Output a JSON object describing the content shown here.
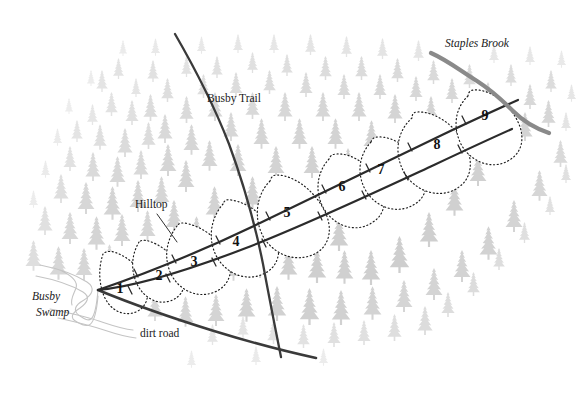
{
  "map": {
    "title_alt": "Forest stand map with numbered transect segments",
    "width": 582,
    "height": 399,
    "background_color": "#ffffff",
    "colors": {
      "tree": "#d2d2d2",
      "tree_light": "#e2e2e2",
      "road_solid": "#3a3a3a",
      "trail": "#3a3a3a",
      "brook": "#8a8a8a",
      "swamp": "#c6c6c6",
      "dotted_boundary": "#1a1a1a",
      "label_text": "#1a1a1a",
      "cell_fill": "#ffffff"
    },
    "labels": [
      {
        "id": "busby-trail",
        "text": "Busby Trail",
        "style": "upright",
        "x": 207,
        "y": 99,
        "font_size": 11.5
      },
      {
        "id": "staples-brook",
        "text": "Staples Brook",
        "style": "italic",
        "x": 445,
        "y": 44,
        "font_size": 11.5
      },
      {
        "id": "hilltop",
        "text": "Hilltop",
        "style": "upright",
        "x": 135,
        "y": 205,
        "font_size": 11.5
      },
      {
        "id": "dirt-road",
        "text": "dirt road",
        "style": "upright",
        "x": 140,
        "y": 334,
        "font_size": 11.5
      },
      {
        "id": "busby-swamp-line1",
        "text": "Busby",
        "style": "italic",
        "x": 32,
        "y": 297,
        "font_size": 11.5
      },
      {
        "id": "busby-swamp-line2",
        "text": "Swamp",
        "style": "italic",
        "x": 36,
        "y": 313,
        "font_size": 11.5
      }
    ],
    "segment_numbers": [
      {
        "label": "1",
        "x": 120,
        "y": 289
      },
      {
        "label": "2",
        "x": 159,
        "y": 276
      },
      {
        "label": "3",
        "x": 194,
        "y": 262
      },
      {
        "label": "4",
        "x": 236,
        "y": 242
      },
      {
        "label": "5",
        "x": 287,
        "y": 213
      },
      {
        "label": "6",
        "x": 342,
        "y": 187
      },
      {
        "label": "7",
        "x": 381,
        "y": 170
      },
      {
        "label": "8",
        "x": 437,
        "y": 145
      },
      {
        "label": "9",
        "x": 485,
        "y": 116
      }
    ],
    "features": {
      "corridor_description": "Two solid parallel curving lines forming a transect band running from lower-left to upper-right, divided into nine numbered cells by dotted cross boundaries.",
      "corridor_upper_path": "M 98 290 C 150 272, 210 246, 262 221 C 320 193, 390 159, 444 133 C 478 117, 500 108, 518 101",
      "corridor_lower_path": "M 98 290 C 142 284, 196 266, 248 246 C 310 222, 380 189, 436 163 C 470 147, 494 136, 512 128",
      "cross_boundaries": [
        "M 104 253 C 101 268, 100 282, 106 297 C 112 311, 124 317, 137 312 C 147 307, 149 296, 146 285 C 142 272, 134 262, 123 256 C 116 252, 109 251, 104 253 Z",
        "M 138 243 C 132 254, 131 268, 137 283 C 143 297, 156 305, 170 302 C 182 298, 187 288, 184 276 C 180 262, 170 251, 158 245 C 150 241, 143 240, 138 243 Z",
        "M 176 227 C 166 240, 164 258, 172 274 C 181 291, 199 298, 215 292 C 229 286, 234 272, 228 258 C 221 241, 206 229, 190 225 C 183 223, 179 224, 176 227 Z",
        "M 222 205 C 210 219, 208 240, 218 257 C 229 275, 250 281, 266 273 C 280 265, 283 249, 275 234 C 266 216, 248 203, 231 201 C 226 200, 224 202, 222 205 Z",
        "M 272 182 C 258 195, 254 218, 264 237 C 276 257, 300 263, 317 253 C 331 244, 333 226, 324 209 C 313 189, 293 176, 278 176 C 274 176, 273 179, 272 182 Z",
        "M 330 160 C 318 172, 315 192, 325 209 C 336 227, 358 232, 373 223 C 386 215, 388 199, 380 183 C 370 165, 352 154, 338 155 C 333 155, 331 157, 330 160 Z",
        "M 372 143 C 360 155, 358 174, 367 191 C 378 209, 399 214, 414 205 C 427 197, 429 181, 421 166 C 411 148, 393 137, 379 138 C 375 138, 373 140, 372 143 Z",
        "M 412 120 C 398 132, 394 154, 405 173 C 417 193, 441 198, 457 188 C 471 179, 473 161, 464 144 C 453 124, 433 113, 418 114 C 414 114, 413 117, 412 120 Z",
        "M 470 98 C 458 109, 455 128, 464 145 C 474 163, 495 168, 510 159 C 523 151, 525 135, 517 120 C 507 102, 489 92, 476 93 C 472 93, 470 95, 470 98 Z"
      ],
      "busby_trail_path": "M 175 35 C 196 70, 214 104, 228 140 C 242 178, 254 222, 262 262 C 270 300, 276 330, 282 357",
      "dirt_road_path": "M 98 290 C 130 303, 170 317, 212 330 C 252 342, 288 351, 316 357",
      "staples_brook_path": "M 432 53 C 448 60, 462 71, 478 81 C 492 90, 502 98, 514 110 C 524 120, 534 127, 548 132",
      "hilltop_leader_path": "M 156 213 L 176 241",
      "swamp_paths": [
        "M 42 266 C 62 271, 78 276, 88 283 C 97 289, 93 296, 85 301 C 76 306, 72 312, 80 317 C 90 323, 100 325, 98 290",
        "M 38 277 C 58 281, 74 287, 84 293 C 92 298, 88 304, 81 309 C 73 314, 70 319, 78 323 C 88 328, 98 330, 98 296",
        "M 52 310 C 72 314, 88 318, 100 322 C 112 326, 122 330, 134 331"
      ]
    }
  }
}
